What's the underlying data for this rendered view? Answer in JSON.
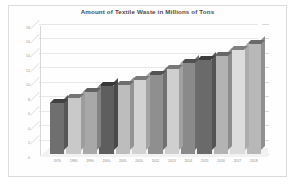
{
  "chart_data": {
    "type": "bar",
    "title": "Amount of Textile Waste in Millions of Tons",
    "xlabel": "",
    "ylabel": "",
    "ylim": [
      0,
      18
    ],
    "ytick_values": [
      0,
      2,
      4,
      6,
      8,
      10,
      12,
      14,
      16,
      18
    ],
    "ytick_labels": [
      "0",
      "2",
      "4",
      "6",
      "8",
      "10",
      "12",
      "14",
      "16",
      "18"
    ],
    "grid": true,
    "legend": false,
    "three_d": true,
    "categories": [
      "1970",
      "1980",
      "1990",
      "2000",
      "2005",
      "2010",
      "2012",
      "2013",
      "2014",
      "2015",
      "2016",
      "2017",
      "2018"
    ],
    "values": [
      7.0,
      7.8,
      8.6,
      9.4,
      9.6,
      10.2,
      11.0,
      11.8,
      12.6,
      13.0,
      13.6,
      14.4,
      15.2
    ],
    "series": [
      {
        "name": "Textile Waste",
        "values": [
          7.0,
          7.8,
          8.6,
          9.4,
          9.6,
          10.2,
          11.0,
          11.8,
          12.6,
          13.0,
          13.6,
          14.4,
          15.2
        ]
      }
    ],
    "bar_colors": [
      "#6f6f6f",
      "#c9c9c9",
      "#a8a8a8",
      "#5e5e5e",
      "#bdbdbd",
      "#d2d2d2",
      "#8f8f8f",
      "#cfcfcf",
      "#8a8a8a",
      "#6a6a6a",
      "#b3b3b3",
      "#dcdcdc",
      "#b8b8b8"
    ],
    "colors": {
      "background": "#ffffff",
      "plot_background": "#fefefe",
      "gridline": "#e8e8e8",
      "axis": "#d8d8d8",
      "title_text": "#4a4a4a",
      "tick_text": "#9a9a9a",
      "frame_border": "#dcdcdc",
      "floor": "#f2f2f2"
    }
  }
}
